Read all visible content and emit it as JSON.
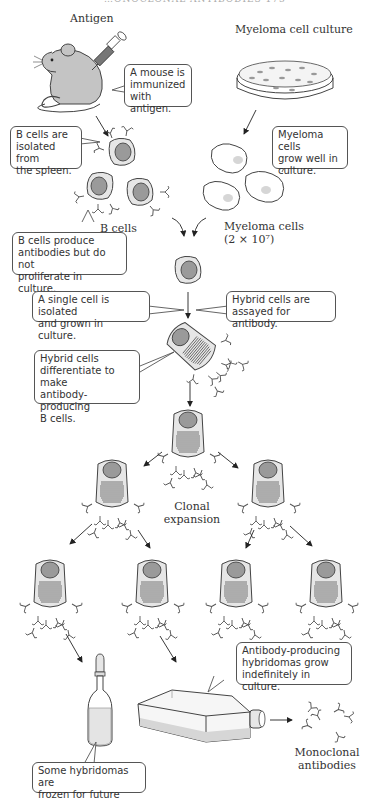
{
  "header": {
    "text": "…ONOCLONAL ANTIBODIES   173"
  },
  "labels": {
    "antigen": "Antigen",
    "myeloma_culture": "Myeloma cell culture",
    "b_cells": "B cells",
    "myeloma_cells": "Myeloma cells\n(2 × 10⁷)",
    "clonal_expansion": "Clonal\nexpansion",
    "monoclonal_antibodies": "Monoclonal\nantibodies"
  },
  "callouts": {
    "mouse_immunized": "A mouse is\nimmunized\nwith antigen.",
    "b_cells_isolated": "B cells are\nisolated from\nthe spleen.",
    "myeloma_grow": "Myeloma cells\ngrow well in\nculture.",
    "b_cells_produce": "B cells produce\nantibodies but do not\nproliferate in culture.",
    "single_cell": "A single cell is isolated\nand grown in culture.",
    "hybrid_assayed": "Hybrid cells are\nassayed for antibody.",
    "hybrid_differentiate": "Hybrid cells\ndifferentiate to make\nantibody-producing\nB cells.",
    "hybridomas_grow": "Antibody-producing\nhybridomas grow\nindefinitely in culture.",
    "frozen": "Some hybridomas are\nfrozen for future use."
  },
  "colors": {
    "line": "#444444",
    "cell_fill": "#e6e6e6",
    "nucleus_fill": "#9a9a9a",
    "mouse_fill": "#c4c4c4",
    "myeloma_nucleus": "#d6d6d6",
    "liquid": "#dcdcdc"
  }
}
